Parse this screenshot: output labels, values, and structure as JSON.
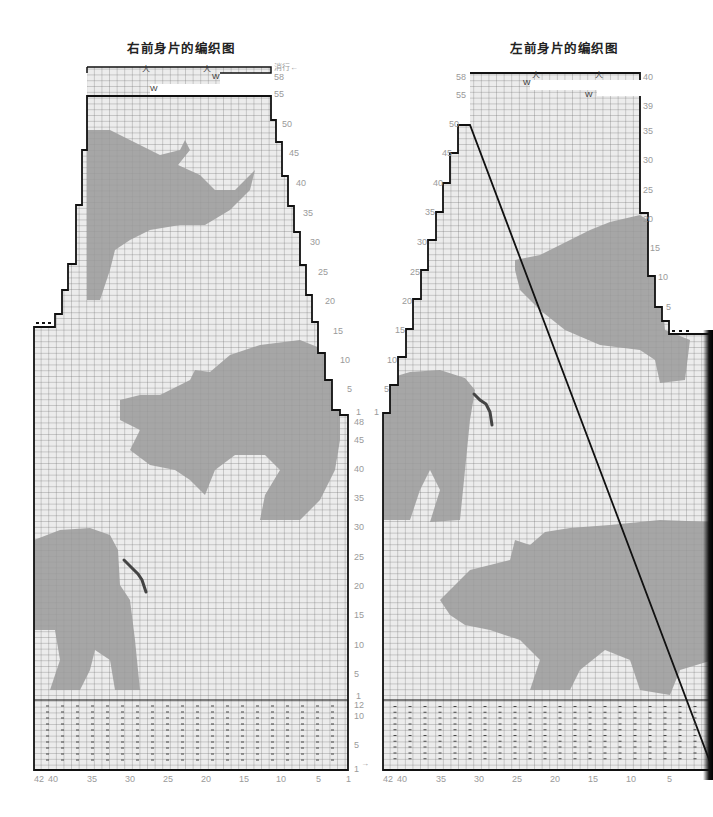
{
  "titles": {
    "right_front": "右前身片的编织图",
    "left_front": "左前身片的编织图"
  },
  "colors": {
    "grid_bg": "#ececec",
    "grid_line": "#5a5a5a",
    "motif": "#9a9a9a",
    "outline": "#111111",
    "axis_label": "#9a9a9a",
    "horn_mark": "#444444"
  },
  "right_chart": {
    "row_marker_label": "消行←",
    "top_row_labels": [
      "58",
      "55",
      "50",
      "45",
      "40",
      "35",
      "30",
      "25",
      "20",
      "15",
      "10",
      "5",
      "1"
    ],
    "body_row_labels": [
      "48",
      "45",
      "40",
      "35",
      "30",
      "25",
      "20",
      "15",
      "10",
      "5",
      "1"
    ],
    "rib_row_labels": [
      "12",
      "10",
      "5",
      "1"
    ],
    "rib_arrow": "→",
    "column_labels": [
      "42",
      "40",
      "35",
      "30",
      "25",
      "20",
      "15",
      "10",
      "5",
      "1"
    ],
    "decrease_symbol": "人",
    "stitch_symbol_top": "W",
    "rib_symbol": "−"
  },
  "left_chart": {
    "top_row_labels": [
      "58",
      "55",
      "50",
      "45",
      "40",
      "35",
      "30",
      "25",
      "20",
      "15",
      "10",
      "5",
      "1"
    ],
    "right_side_labels": [
      "40",
      "39",
      "35",
      "30",
      "25",
      "20",
      "15",
      "10",
      "5"
    ],
    "column_labels": [
      "42",
      "40",
      "35",
      "30",
      "25",
      "20",
      "15",
      "10",
      "5"
    ],
    "decrease_symbol": "人",
    "stitch_symbol_top": "W",
    "rib_symbol": "−"
  }
}
